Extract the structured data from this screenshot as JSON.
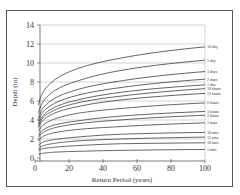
{
  "chart_data": {
    "type": "line",
    "title": "",
    "xlabel": "Return Period (years)",
    "ylabel": "Depth (in)",
    "xlim": [
      0,
      100
    ],
    "ylim": [
      0,
      14
    ],
    "xticks": [
      0,
      20,
      40,
      60,
      80,
      100
    ],
    "yticks": [
      0,
      2,
      4,
      6,
      8,
      10,
      12,
      14
    ],
    "grid": "horizontal",
    "legend": "inline labels at right end of each curve",
    "x": [
      2,
      5,
      10,
      25,
      50,
      100
    ],
    "series": [
      {
        "name": "10 day",
        "values": [
          5.6,
          7.0,
          8.0,
          9.4,
          10.5,
          11.7
        ]
      },
      {
        "name": "5 day",
        "values": [
          4.7,
          6.0,
          6.9,
          8.1,
          9.2,
          10.3
        ]
      },
      {
        "name": "3 days",
        "values": [
          4.2,
          5.3,
          6.1,
          7.2,
          8.1,
          9.1
        ]
      },
      {
        "name": "2 days",
        "values": [
          3.9,
          4.9,
          5.6,
          6.6,
          7.4,
          8.3
        ]
      },
      {
        "name": "1 day",
        "values": [
          3.6,
          4.5,
          5.2,
          6.1,
          6.9,
          7.7
        ]
      },
      {
        "name": "18 hours",
        "values": [
          3.4,
          4.3,
          4.9,
          5.8,
          6.5,
          7.3
        ]
      },
      {
        "name": "12 hours",
        "values": [
          3.2,
          4.0,
          4.6,
          5.4,
          6.1,
          6.8
        ]
      },
      {
        "name": "6 hours",
        "values": [
          2.8,
          3.5,
          4.0,
          4.7,
          5.2,
          5.8
        ]
      },
      {
        "name": "3 hours",
        "values": [
          2.4,
          3.0,
          3.4,
          3.9,
          4.4,
          4.9
        ]
      },
      {
        "name": "2 hours",
        "values": [
          2.2,
          2.7,
          3.1,
          3.6,
          4.0,
          4.5
        ]
      },
      {
        "name": "1 hour",
        "values": [
          1.8,
          2.3,
          2.6,
          3.0,
          3.3,
          3.7
        ]
      },
      {
        "name": "30 min.",
        "values": [
          1.3,
          1.7,
          1.9,
          2.2,
          2.5,
          2.7
        ]
      },
      {
        "name": "15 min.",
        "values": [
          1.0,
          1.3,
          1.5,
          1.8,
          2.0,
          2.2
        ]
      },
      {
        "name": "10 min.",
        "values": [
          0.8,
          1.0,
          1.1,
          1.3,
          1.5,
          1.6
        ]
      },
      {
        "name": "5 min.",
        "values": [
          0.4,
          0.5,
          0.6,
          0.7,
          0.8,
          0.9
        ]
      }
    ],
    "colors": {
      "line": "#222222",
      "grid": "#bbbbbb",
      "frame": "#555555"
    }
  }
}
